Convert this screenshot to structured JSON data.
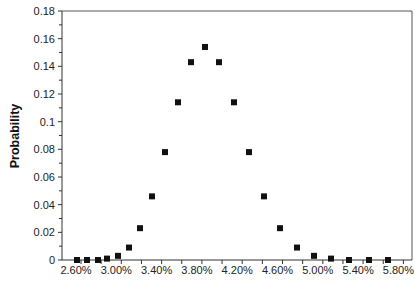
{
  "chart_data": {
    "type": "scatter",
    "title": "",
    "xlabel": "",
    "ylabel": "Probability",
    "ylim": [
      0,
      0.18
    ],
    "xlim": [
      2.6,
      6.05
    ],
    "grid": false,
    "legend": null,
    "marker": "square",
    "y_ticks": [
      "0",
      "0.02",
      "0.04",
      "0.06",
      "0.08",
      "0.1",
      "0.12",
      "0.14",
      "0.16",
      "0.18"
    ],
    "x_ticks": [
      "2.60%",
      "3.00%",
      "3.40%",
      "3.80%",
      "4.20%",
      "4.60%",
      "5.00%",
      "5.40%",
      "5.80%"
    ],
    "x": [
      2.67,
      2.77,
      2.88,
      2.97,
      3.08,
      3.19,
      3.3,
      3.42,
      3.55,
      3.68,
      3.81,
      3.95,
      4.09,
      4.24,
      4.39,
      4.54,
      4.7,
      4.87,
      5.04,
      5.21,
      5.39,
      5.58,
      5.77
    ],
    "y": [
      0.0,
      0.0,
      0.0,
      0.001,
      0.003,
      0.009,
      0.023,
      0.046,
      0.078,
      0.114,
      0.143,
      0.154,
      0.143,
      0.114,
      0.078,
      0.046,
      0.023,
      0.009,
      0.003,
      0.001,
      0.0,
      0.0,
      0.0
    ],
    "px_x": [
      77,
      87,
      98,
      107,
      118,
      129,
      140,
      152,
      165,
      178,
      191,
      205,
      219,
      234,
      249,
      264,
      280,
      297,
      314,
      331,
      349,
      369,
      388
    ]
  }
}
